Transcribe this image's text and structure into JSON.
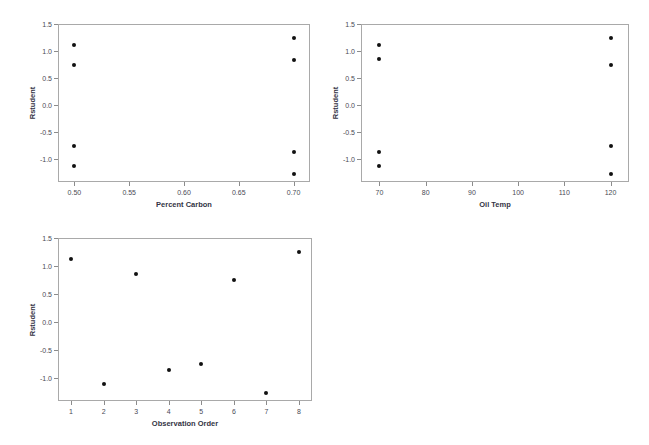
{
  "chart_data": [
    {
      "id": "carbon",
      "type": "scatter",
      "title": "",
      "xlabel": "Percent Carbon",
      "ylabel": "Rstudent",
      "xlim": [
        0.485,
        0.715
      ],
      "ylim": [
        -1.42,
        1.5
      ],
      "grid": false,
      "legend": false,
      "xticks": [
        0.5,
        0.55,
        0.6,
        0.65,
        0.7
      ],
      "xticklabels": [
        "0.50",
        "0.55",
        "0.60",
        "0.65",
        "0.70"
      ],
      "yticks": [
        1.5,
        1.0,
        0.5,
        0.0,
        -0.5,
        -1.0
      ],
      "yticklabels": [
        "1.5",
        "1.0",
        "0.5",
        "0.0",
        "-0.5",
        "-1.0"
      ],
      "points": [
        {
          "x": 0.5,
          "y": 1.12
        },
        {
          "x": 0.5,
          "y": 0.74
        },
        {
          "x": 0.5,
          "y": -0.75
        },
        {
          "x": 0.5,
          "y": -1.12
        },
        {
          "x": 0.7,
          "y": 1.25
        },
        {
          "x": 0.7,
          "y": 0.84
        },
        {
          "x": 0.7,
          "y": -0.87
        },
        {
          "x": 0.7,
          "y": -1.28
        }
      ]
    },
    {
      "id": "oiltemp",
      "type": "scatter",
      "title": "",
      "xlabel": "Oil Temp",
      "ylabel": "Rstudent",
      "xlim": [
        66,
        124
      ],
      "ylim": [
        -1.42,
        1.5
      ],
      "grid": false,
      "legend": false,
      "xticks": [
        70,
        80,
        90,
        100,
        110,
        120
      ],
      "xticklabels": [
        "70",
        "80",
        "90",
        "100",
        "110",
        "120"
      ],
      "yticks": [
        1.5,
        1.0,
        0.5,
        0.0,
        -0.5,
        -1.0
      ],
      "yticklabels": [
        "1.5",
        "1.0",
        "0.5",
        "0.0",
        "-0.5",
        "-1.0"
      ],
      "points": [
        {
          "x": 70,
          "y": 1.12
        },
        {
          "x": 70,
          "y": 0.86
        },
        {
          "x": 70,
          "y": -0.87
        },
        {
          "x": 70,
          "y": -1.12
        },
        {
          "x": 120,
          "y": 1.25
        },
        {
          "x": 120,
          "y": 0.74
        },
        {
          "x": 120,
          "y": -0.76
        },
        {
          "x": 120,
          "y": -1.28
        }
      ]
    },
    {
      "id": "order",
      "type": "scatter",
      "title": "",
      "xlabel": "Observation Order",
      "ylabel": "Rstudent",
      "xlim": [
        0.6,
        8.4
      ],
      "ylim": [
        -1.42,
        1.5
      ],
      "grid": false,
      "legend": false,
      "xticks": [
        1,
        2,
        3,
        4,
        5,
        6,
        7,
        8
      ],
      "xticklabels": [
        "1",
        "2",
        "3",
        "4",
        "5",
        "6",
        "7",
        "8"
      ],
      "yticks": [
        1.5,
        1.0,
        0.5,
        0.0,
        -0.5,
        -1.0
      ],
      "yticklabels": [
        "1.5",
        "1.0",
        "0.5",
        "0.0",
        "-0.5",
        "-1.0"
      ],
      "points": [
        {
          "x": 1,
          "y": 1.12
        },
        {
          "x": 2,
          "y": -1.12
        },
        {
          "x": 3,
          "y": 0.85
        },
        {
          "x": 4,
          "y": -0.87
        },
        {
          "x": 5,
          "y": -0.76
        },
        {
          "x": 6,
          "y": 0.74
        },
        {
          "x": 7,
          "y": -1.28
        },
        {
          "x": 8,
          "y": 1.25
        }
      ]
    }
  ]
}
